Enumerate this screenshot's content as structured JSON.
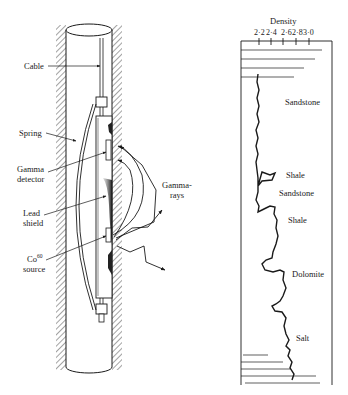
{
  "tool_diagram": {
    "labels": {
      "cable": "Cable",
      "spring": "Spring",
      "gamma_detector_1": "Gamma",
      "gamma_detector_2": "detector",
      "lead_shield_1": "Lead",
      "lead_shield_2": "shield",
      "source_1": "Co",
      "source_sup": "60",
      "source_2": "source",
      "gamma_rays_1": "Gamma-",
      "gamma_rays_2": "rays"
    }
  },
  "density_log": {
    "title": "Density",
    "ticks": [
      "2·2",
      "2·4",
      "2·6",
      "2·8",
      "3·0"
    ],
    "lithologies": [
      {
        "name": "Sandstone"
      },
      {
        "name": "Shale"
      },
      {
        "name": "Sandstone"
      },
      {
        "name": "Shale"
      },
      {
        "name": "Dolomite"
      },
      {
        "name": "Salt"
      }
    ]
  },
  "colors": {
    "ink": "#1a1a1a",
    "shadow": "#555555",
    "background": "#ffffff"
  }
}
